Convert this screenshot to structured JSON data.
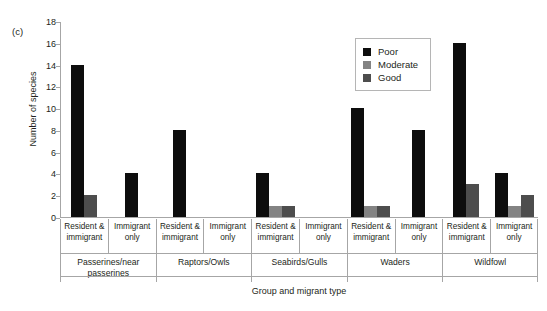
{
  "panel_label": "(c)",
  "legend": {
    "entries": [
      {
        "label": "Poor",
        "color": "#0d0d0d",
        "key": "poor"
      },
      {
        "label": "Moderate",
        "color": "#838383",
        "key": "moderate"
      },
      {
        "label": "Good",
        "color": "#4d4d4d",
        "key": "good"
      }
    ]
  },
  "chart_data": {
    "type": "bar",
    "title": "",
    "xlabel": "Group and migrant type",
    "ylabel": "Number of species",
    "ylim": [
      0,
      18
    ],
    "yticks": [
      0,
      2,
      4,
      6,
      8,
      10,
      12,
      14,
      16,
      18
    ],
    "grid": false,
    "legend_position": "top-right",
    "groups": [
      "Passerines/near passerines",
      "Raptors/Owls",
      "Seabirds/Gulls",
      "Waders",
      "Wildfowl"
    ],
    "migrant_types": [
      "Resident & immigrant",
      "Immigrant only"
    ],
    "categories": [
      "Passerines/near passerines — Resident & immigrant",
      "Passerines/near passerines — Immigrant only",
      "Raptors/Owls — Resident & immigrant",
      "Raptors/Owls — Immigrant only",
      "Seabirds/Gulls — Resident & immigrant",
      "Seabirds/Gulls — Immigrant only",
      "Waders — Resident & immigrant",
      "Waders — Immigrant only",
      "Wildfowl — Resident & immigrant",
      "Wildfowl — Immigrant only"
    ],
    "series": [
      {
        "name": "Poor",
        "values": [
          14,
          4,
          8,
          0,
          4,
          0,
          10,
          8,
          16,
          4
        ]
      },
      {
        "name": "Moderate",
        "values": [
          0,
          0,
          0,
          0,
          1,
          0,
          1,
          0,
          0,
          1
        ]
      },
      {
        "name": "Good",
        "values": [
          2,
          0,
          0,
          0,
          1,
          0,
          1,
          0,
          3,
          2
        ]
      }
    ]
  },
  "cat_labels": [
    {
      "line1": "Resident &",
      "line2": "immigrant"
    },
    {
      "line1": "Immigrant",
      "line2": "only"
    },
    {
      "line1": "Resident &",
      "line2": "immigrant"
    },
    {
      "line1": "Immigrant",
      "line2": "only"
    },
    {
      "line1": "Resident &",
      "line2": "immigrant"
    },
    {
      "line1": "Immigrant",
      "line2": "only"
    },
    {
      "line1": "Resident &",
      "line2": "immigrant"
    },
    {
      "line1": "Immigrant",
      "line2": "only"
    },
    {
      "line1": "Resident &",
      "line2": "immigrant"
    },
    {
      "line1": "Immigrant",
      "line2": "only"
    }
  ],
  "group_labels": [
    {
      "line1": "Passerines/near",
      "line2": "passerines"
    },
    {
      "line1": "Raptors/Owls",
      "line2": ""
    },
    {
      "line1": "Seabirds/Gulls",
      "line2": ""
    },
    {
      "line1": "Waders",
      "line2": ""
    },
    {
      "line1": "Wildfowl",
      "line2": ""
    }
  ],
  "y_ticks_display": [
    "0",
    "2",
    "4",
    "6",
    "8",
    "10",
    "12",
    "14",
    "16",
    "18"
  ]
}
